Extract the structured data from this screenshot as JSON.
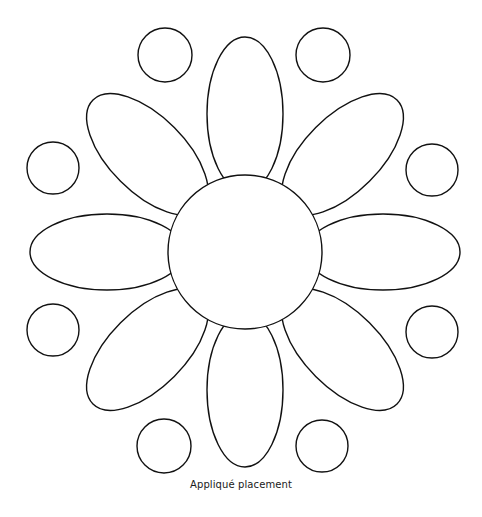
{
  "figure": {
    "caption": "Appliqué placement",
    "stroke_color": "#111111",
    "fill_color": "#ffffff",
    "background": "#ffffff"
  },
  "flower": {
    "center": {
      "cx": 245,
      "cy": 252,
      "r": 77
    },
    "petals": [
      {
        "name": "petal-top",
        "angle": 0
      },
      {
        "name": "petal-top-right",
        "angle": 45
      },
      {
        "name": "petal-right",
        "angle": 90
      },
      {
        "name": "petal-bottom-right",
        "angle": 135
      },
      {
        "name": "petal-bottom",
        "angle": 180
      },
      {
        "name": "petal-bottom-left",
        "angle": 225
      },
      {
        "name": "petal-left",
        "angle": 270
      },
      {
        "name": "petal-top-left",
        "angle": 315
      }
    ],
    "petal_shape": {
      "distance": 138,
      "rx": 38,
      "ry": 77
    }
  },
  "dots": [
    {
      "name": "dot-top-left",
      "cx": 165,
      "cy": 55,
      "r": 27
    },
    {
      "name": "dot-top-right",
      "cx": 323,
      "cy": 55,
      "r": 27
    },
    {
      "name": "dot-left-upper",
      "cx": 53,
      "cy": 168,
      "r": 26
    },
    {
      "name": "dot-right-upper",
      "cx": 432,
      "cy": 170,
      "r": 26
    },
    {
      "name": "dot-left-lower",
      "cx": 53,
      "cy": 330,
      "r": 26
    },
    {
      "name": "dot-right-lower",
      "cx": 432,
      "cy": 332,
      "r": 26
    },
    {
      "name": "dot-bottom-left",
      "cx": 164,
      "cy": 446,
      "r": 27
    },
    {
      "name": "dot-bottom-right",
      "cx": 322,
      "cy": 446,
      "r": 26
    }
  ]
}
